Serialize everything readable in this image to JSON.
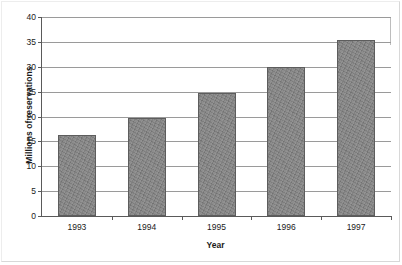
{
  "chart_data": {
    "type": "bar",
    "title": "",
    "subtitle": "",
    "xlabel": "Year",
    "ylabel": "Millions of reservations",
    "categories": [
      "1993",
      "1994",
      "1995",
      "1996",
      "1997"
    ],
    "values": [
      16.3,
      19.8,
      24.8,
      29.9,
      35.4
    ],
    "series": [
      {
        "name": "Millions of reservations",
        "values": [
          16.3,
          19.8,
          24.8,
          29.9,
          35.4
        ]
      }
    ],
    "ylim": [
      0,
      40
    ],
    "y_ticks": [
      "0",
      "5",
      "10",
      "15",
      "20",
      "25",
      "30",
      "35",
      "40"
    ],
    "y_tick_values": [
      0,
      5,
      10,
      15,
      20,
      25,
      30,
      35,
      40
    ],
    "grid": true,
    "grid_axis": "y",
    "legend": false,
    "legend_position": "none",
    "annotations": [],
    "colors": {
      "bar_fill": "#7e7e7e",
      "bar_border": "#5d5d5d",
      "gridline": "#9a9a9a",
      "axis": "#5a5a5a",
      "text": "#1a1a1a",
      "background": "#ffffff"
    }
  }
}
